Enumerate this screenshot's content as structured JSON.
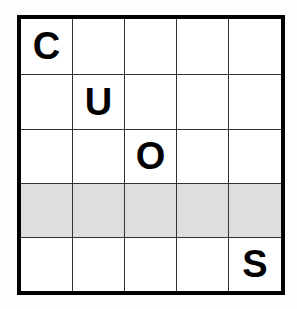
{
  "puzzle": {
    "rows": 5,
    "cols": 5,
    "shaded_row": 3,
    "shade_color": "#dedede",
    "cells": [
      [
        "C",
        "",
        "",
        "",
        ""
      ],
      [
        "",
        "U",
        "",
        "",
        ""
      ],
      [
        "",
        "",
        "O",
        "",
        ""
      ],
      [
        "",
        "",
        "",
        "",
        ""
      ],
      [
        "",
        "",
        "",
        "",
        "S"
      ]
    ]
  }
}
